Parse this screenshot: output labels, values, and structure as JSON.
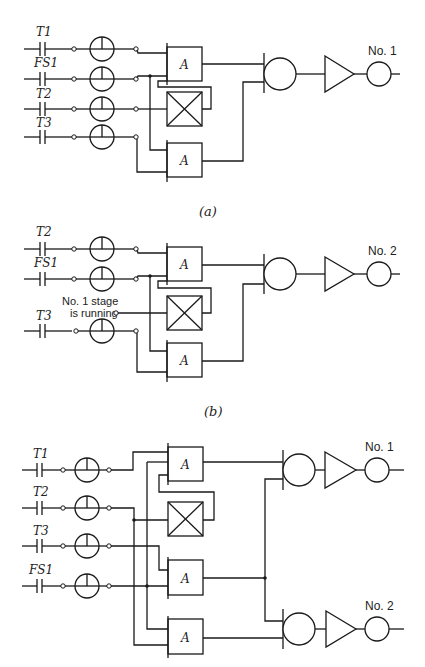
{
  "figure": {
    "colors": {
      "line": "#1a1a1a",
      "background": "#ffffff"
    },
    "panels": [
      {
        "id": "a",
        "caption": "(a)",
        "inputs": [
          "T1",
          "FS1",
          "T2",
          "T3"
        ],
        "gates": [
          "A",
          "A"
        ],
        "output_label": "No. 1"
      },
      {
        "id": "b",
        "caption": "(b)",
        "inputs": [
          "T2",
          "FS1",
          "T3"
        ],
        "extra_input": {
          "line1": "No. 1 stage",
          "line2": "is running"
        },
        "gates": [
          "A",
          "A"
        ],
        "output_label": "No. 2"
      },
      {
        "id": "c",
        "caption": "",
        "inputs": [
          "T1",
          "T2",
          "T3",
          "FS1"
        ],
        "gates": [
          "A",
          "A",
          "A"
        ],
        "output_labels": [
          "No. 1",
          "No. 2"
        ]
      }
    ]
  }
}
